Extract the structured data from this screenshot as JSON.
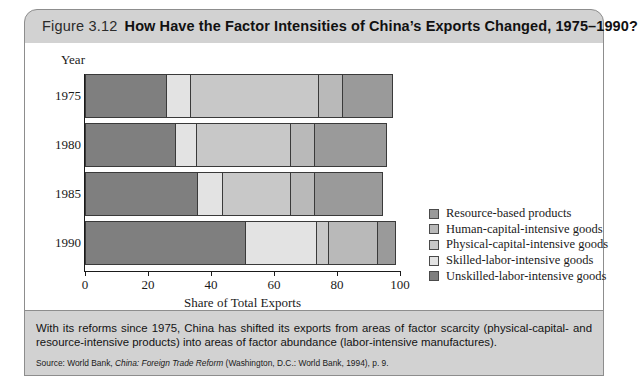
{
  "figure": {
    "number": "Figure 3.12",
    "title": "How Have the Factor Intensities of China’s Exports Changed, 1975–1990?"
  },
  "axes": {
    "y_header": "Year",
    "x_title": "Share of Total Exports",
    "x_ticks": [
      "0",
      "20",
      "40",
      "60",
      "80",
      "100"
    ],
    "y_ticks": [
      "1975",
      "1980",
      "1985",
      "1990"
    ]
  },
  "legend": [
    {
      "label": "Resource-based products",
      "color": "#9a9a9a"
    },
    {
      "label": "Human-capital-intensive goods",
      "color": "#b9b9b9"
    },
    {
      "label": "Physical-capital-intensive goods",
      "color": "#c8c8c8"
    },
    {
      "label": "Skilled-labor-intensive goods",
      "color": "#e3e3e3"
    },
    {
      "label": "Unskilled-labor-intensive goods",
      "color": "#7f7f7f"
    }
  ],
  "note": {
    "text": "With its reforms since 1975, China has shifted its exports from areas of factor scarcity (physical-capital- and resource-intensive products) into areas of factor abundance (labor-intensive manufactures).",
    "source_prefix": "Source: World Bank, ",
    "source_italic": "China: Foreign Trade Reform",
    "source_suffix": " (Washington, D.C.: World Bank, 1994), p. 9."
  },
  "chart_data": {
    "type": "bar",
    "orientation": "horizontal",
    "stacked": true,
    "title": "How Have the Factor Intensities of China’s Exports Changed, 1975–1990?",
    "xlabel": "Share of Total Exports",
    "ylabel": "Year",
    "xlim": [
      0,
      100
    ],
    "grid": false,
    "legend_position": "right",
    "categories": [
      "1975",
      "1980",
      "1985",
      "1990"
    ],
    "series": [
      {
        "name": "Unskilled-labor-intensive goods",
        "color": "#7f7f7f",
        "values": [
          26,
          29,
          36,
          51
        ]
      },
      {
        "name": "Skilled-labor-intensive goods",
        "color": "#e3e3e3",
        "values": [
          8,
          7,
          8,
          23
        ]
      },
      {
        "name": "Physical-capital-intensive goods",
        "color": "#c8c8c8",
        "values": [
          41,
          30,
          22,
          4
        ]
      },
      {
        "name": "Human-capital-intensive goods",
        "color": "#b9b9b9",
        "values": [
          8,
          8,
          8,
          16
        ]
      },
      {
        "name": "Resource-based products",
        "color": "#9a9a9a",
        "values": [
          16,
          23,
          22,
          6
        ]
      }
    ],
    "totals": [
      99,
      97,
      96,
      100
    ]
  }
}
